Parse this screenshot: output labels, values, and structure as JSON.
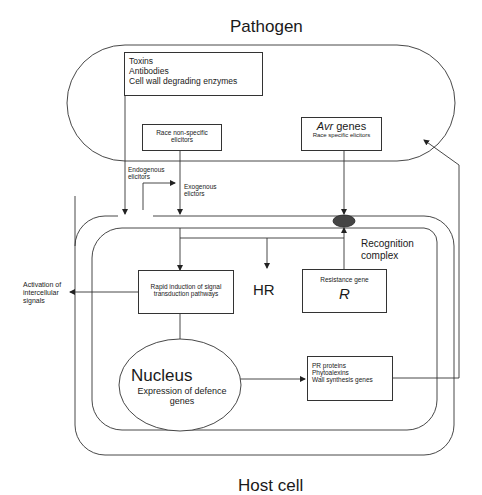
{
  "title_top": "Pathogen",
  "title_bottom": "Host cell",
  "pathogen": {
    "virulence_box": {
      "lines": [
        "Toxins",
        "Antibodies",
        "Cell wall degrading enzymes"
      ]
    },
    "nonspecific_box": {
      "line1": "Race non-specific",
      "line2": "elicitors"
    },
    "avr_box": {
      "italic": "Avr",
      "rest": " genes",
      "subtitle": "Race specific elicitors"
    }
  },
  "labels": {
    "endogenous": [
      "Endogenous",
      "elicitors"
    ],
    "exogenous": [
      "Exogenous",
      "elictors"
    ],
    "activation": [
      "Activation of",
      "intercellular",
      "signals"
    ],
    "recognition": [
      "Recognition",
      "complex"
    ],
    "hr": "HR"
  },
  "host": {
    "signal_box": {
      "line1": "Rapid induction of signal",
      "line2": "transduction pathways"
    },
    "resistance_box": {
      "label": "Resistance gene",
      "symbol": "R"
    },
    "nucleus": {
      "title": "Nucleus",
      "line1": "Expression of defence",
      "line2": "genes"
    },
    "defence_box": {
      "lines": [
        "PR proteins",
        "Phytoalexins",
        "Wall synthesis genes"
      ]
    }
  },
  "colors": {
    "line": "#333333",
    "receptor": "#444444",
    "background": "#ffffff"
  }
}
